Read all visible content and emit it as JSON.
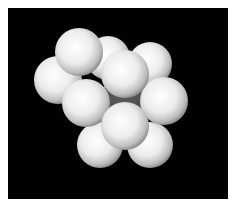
{
  "scene": {
    "description": "Rendered cluster of identical white spheres on black background",
    "background": "#000000",
    "border_color": "#ffffff",
    "sphere_color": "#f2f2f2",
    "sphere_count": 11
  },
  "spheres": [
    {
      "id": "back-center",
      "cx": 108,
      "cy": 58,
      "r": 22
    },
    {
      "id": "top-right",
      "cx": 150,
      "cy": 64,
      "r": 22
    },
    {
      "id": "left",
      "cx": 58,
      "cy": 80,
      "r": 24
    },
    {
      "id": "top-left-front",
      "cx": 79,
      "cy": 52,
      "r": 24
    },
    {
      "id": "bottom-left",
      "cx": 100,
      "cy": 145,
      "r": 23
    },
    {
      "id": "bottom-right",
      "cx": 150,
      "cy": 145,
      "r": 23
    },
    {
      "id": "center-ghost",
      "cx": 125,
      "cy": 100,
      "r": 24,
      "transparent": true
    },
    {
      "id": "mid-left",
      "cx": 86,
      "cy": 103,
      "r": 24
    },
    {
      "id": "right",
      "cx": 164,
      "cy": 101,
      "r": 24
    },
    {
      "id": "center-top",
      "cx": 125,
      "cy": 74,
      "r": 24
    },
    {
      "id": "center-bottom",
      "cx": 125,
      "cy": 126,
      "r": 24
    }
  ]
}
